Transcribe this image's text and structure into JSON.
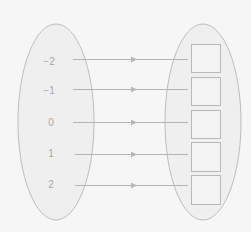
{
  "diagram": {
    "type": "mapping",
    "domain": {
      "values": [
        "−2",
        "−1",
        "0",
        "1",
        "2"
      ]
    },
    "codomain": {
      "boxes": [
        "",
        "",
        "",
        "",
        ""
      ]
    },
    "arrows": [
      {
        "from": "−2",
        "to_box": 0
      },
      {
        "from": "−1",
        "to_box": 1
      },
      {
        "from": "0",
        "to_box": 2
      },
      {
        "from": "1",
        "to_box": 3
      },
      {
        "from": "2",
        "to_box": 4
      }
    ],
    "colors": {
      "background": "#f6f6f6",
      "ellipse_fill": "#efefef",
      "stroke": "#b4b4b4",
      "text": "#a8a8a8"
    }
  }
}
